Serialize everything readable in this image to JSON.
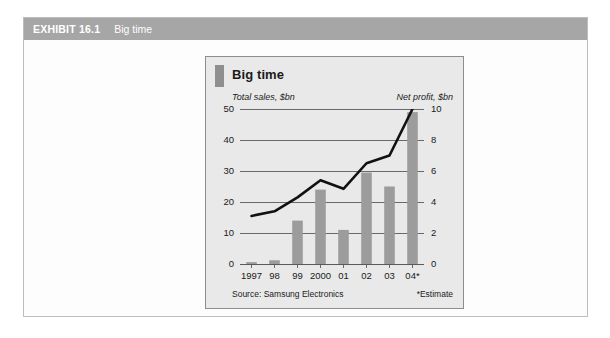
{
  "exhibit": {
    "number": "EXHIBIT 16.1",
    "caption": "Big time",
    "header_bg": "#a6a6a6",
    "frame_bg": "#fdfdfd"
  },
  "chart_panel": {
    "title": "Big time",
    "panel_bg": "#e9e9e9",
    "tab_color": "#8f8f8f",
    "source": "Source: Samsung Electronics",
    "footnote": "*Estimate"
  },
  "chart_data": {
    "type": "bar",
    "title": "Big time",
    "categories": [
      "1997",
      "98",
      "99",
      "2000",
      "01",
      "02",
      "03",
      "04*"
    ],
    "xlabel": "",
    "grid": true,
    "legend": "none",
    "series": [
      {
        "name": "Total sales, $bn",
        "type": "bar",
        "axis": "left",
        "color": "#9c9c9c",
        "values": [
          0.6,
          1.2,
          14.0,
          24.0,
          11.0,
          29.5,
          25.0,
          49.0
        ],
        "ylabel": "Total sales, $bn",
        "ylim": [
          0,
          50
        ],
        "yticks": [
          0,
          10,
          20,
          30,
          40,
          50
        ]
      },
      {
        "name": "Net profit, $bn",
        "type": "line",
        "axis": "right",
        "color": "#111111",
        "values": [
          3.1,
          3.4,
          4.3,
          5.4,
          4.85,
          6.5,
          7.0,
          10.0
        ],
        "ylabel": "Net profit, $bn",
        "ylim": [
          0,
          10
        ],
        "yticks": [
          0,
          2,
          4,
          6,
          8,
          10
        ]
      }
    ],
    "left_ticks": [
      "0",
      "10",
      "20",
      "30",
      "40",
      "50"
    ],
    "right_ticks": [
      "0",
      "2",
      "4",
      "6",
      "8",
      "10"
    ],
    "source": "Source: Samsung Electronics",
    "annotation": "*Estimate"
  }
}
